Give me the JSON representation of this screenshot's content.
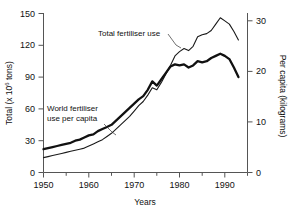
{
  "chart_data": {
    "type": "line",
    "title": "",
    "xlabel": "Years",
    "ylabel": "Total (x 10^6 tons)",
    "ylabel_main": "Total (x 10",
    "ylabel_sup": "6",
    "ylabel_tail": " tons)",
    "y2label": "Per capita (kilograms)",
    "xlim": [
      1950,
      1995
    ],
    "ylim": [
      0,
      150
    ],
    "y2lim": [
      0,
      31.5
    ],
    "grid": false,
    "legend_position": "inline-annotations",
    "xticks": [
      1950,
      1960,
      1970,
      1980,
      1990
    ],
    "xtick_labels": [
      "1950",
      "1960",
      "1970",
      "1980",
      "1990"
    ],
    "xminor_ticks": [
      1955,
      1965,
      1975,
      1985,
      1995
    ],
    "yticks": [
      0,
      30,
      60,
      90,
      120,
      150
    ],
    "ytick_labels": [
      "0",
      "30",
      "60",
      "90",
      "120",
      "150"
    ],
    "y2ticks": [
      0,
      10,
      20,
      30
    ],
    "y2tick_labels": [
      "0",
      "10",
      "20",
      "30"
    ],
    "annotations": [
      {
        "text": "Total fertiliser use",
        "name": "total-fertiliser-use-label"
      },
      {
        "text_line1": "World fertiliser",
        "text_line2": "use per capita",
        "name": "world-fertiliser-per-capita-label"
      }
    ],
    "series": [
      {
        "name": "Total fertiliser use",
        "axis": "left",
        "units": "million tons",
        "stroke": "#1a1a1a",
        "width": 1.1,
        "x": [
          1950,
          1951,
          1952,
          1953,
          1954,
          1955,
          1956,
          1957,
          1958,
          1959,
          1960,
          1961,
          1962,
          1963,
          1964,
          1965,
          1966,
          1967,
          1968,
          1969,
          1970,
          1971,
          1972,
          1973,
          1974,
          1975,
          1976,
          1977,
          1978,
          1979,
          1980,
          1981,
          1982,
          1983,
          1984,
          1985,
          1986,
          1987,
          1988,
          1989,
          1990,
          1991,
          1992,
          1993
        ],
        "values": [
          14,
          15,
          16,
          17,
          18,
          19,
          20,
          21,
          22,
          23,
          25,
          27,
          29,
          31,
          34,
          37,
          41,
          45,
          49,
          53,
          58,
          63,
          67,
          73,
          80,
          78,
          85,
          93,
          101,
          110,
          114,
          117,
          115,
          119,
          128,
          130,
          131,
          134,
          140,
          146,
          143,
          140,
          133,
          125
        ]
      },
      {
        "name": "World fertiliser use per capita",
        "axis": "right",
        "units": "kilograms",
        "stroke": "#111111",
        "width": 2.2,
        "x": [
          1950,
          1951,
          1952,
          1953,
          1954,
          1955,
          1956,
          1957,
          1958,
          1959,
          1960,
          1961,
          1962,
          1963,
          1964,
          1965,
          1966,
          1967,
          1968,
          1969,
          1970,
          1971,
          1972,
          1973,
          1974,
          1975,
          1976,
          1977,
          1978,
          1979,
          1980,
          1981,
          1982,
          1983,
          1984,
          1985,
          1986,
          1987,
          1988,
          1989,
          1990,
          1991,
          1992,
          1993
        ],
        "values_left_equiv": [
          22,
          23,
          24,
          25,
          26,
          27,
          28,
          30,
          31,
          33,
          35,
          36,
          39,
          41,
          43,
          45,
          49,
          53,
          57,
          61,
          65,
          69,
          72,
          78,
          86,
          82,
          88,
          94,
          100,
          102,
          101,
          102,
          99,
          101,
          105,
          104,
          105,
          108,
          110,
          112,
          110,
          107,
          99,
          90
        ],
        "values": [
          4.6,
          4.8,
          5.0,
          5.2,
          5.5,
          5.7,
          5.9,
          6.3,
          6.5,
          6.9,
          7.3,
          7.6,
          8.2,
          8.6,
          9.0,
          9.4,
          10.3,
          11.1,
          12.0,
          12.8,
          13.7,
          14.5,
          15.1,
          16.4,
          18.1,
          17.2,
          18.5,
          19.7,
          21.0,
          21.4,
          21.2,
          21.4,
          20.8,
          21.2,
          22.1,
          21.8,
          22.1,
          22.7,
          23.1,
          23.5,
          23.1,
          22.5,
          20.8,
          18.9
        ]
      }
    ]
  }
}
